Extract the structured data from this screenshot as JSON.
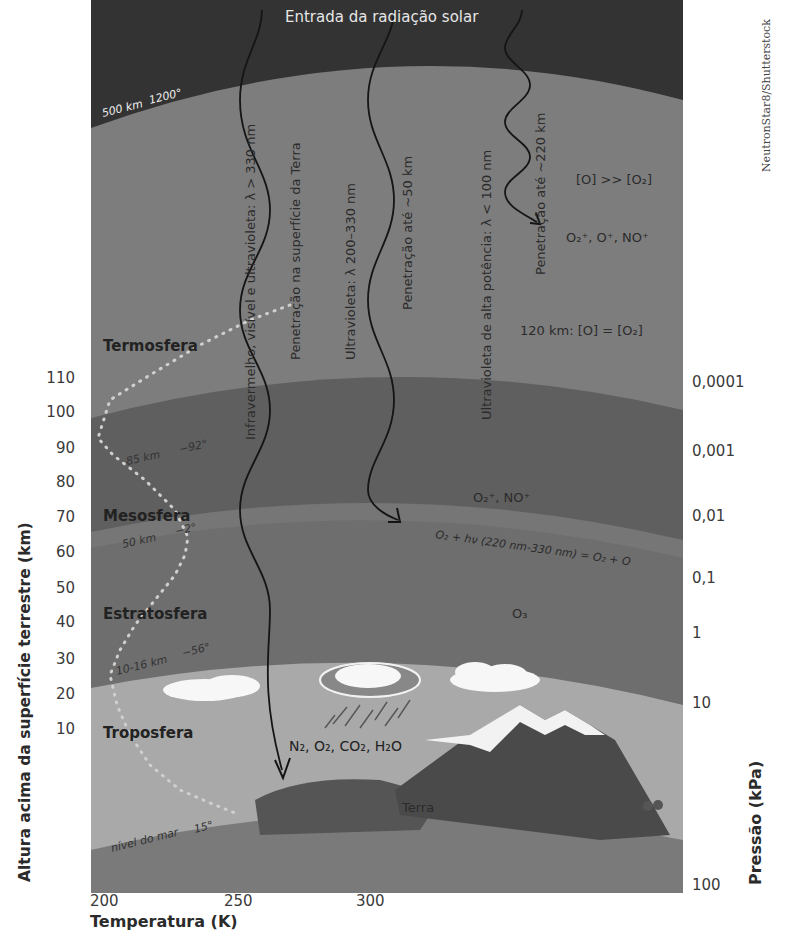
{
  "diagram": {
    "title": "Entrada da radiação solar",
    "credit": "NeutronStar8/Shutterstock",
    "layers": [
      {
        "name": "Termosfera",
        "top_km": "500 km",
        "top_temp": "1200°"
      },
      {
        "name": "Mesosfera",
        "top_km": "85 km",
        "top_temp": "−92°"
      },
      {
        "name": "Estratosfera",
        "top_km": "50 km",
        "top_temp": "−2°"
      },
      {
        "name": "Troposfera",
        "top_km": "10-16 km",
        "top_temp": "−56°"
      }
    ],
    "sea_level": {
      "label": "nível do mar",
      "temp": "15°"
    },
    "radiation": [
      {
        "label": "Infravermelho, visível e ultravioleta: λ > 330 nm",
        "penetration": "Penetração na superfície da Terra"
      },
      {
        "label": "Ultravioleta: λ 200–330 nm",
        "penetration": "Penetração até ~50 km"
      },
      {
        "label": "Ultravioleta de alta potência: λ < 100 nm",
        "penetration": "Penetração até ~220 km"
      }
    ],
    "chemistry": {
      "o_ratio": "[O] >> [O₂]",
      "thermo_ions": "O₂⁺, O⁺, NO⁺",
      "km120": "120 km: [O] = [O₂]",
      "meso_ions": "O₂⁺, NO⁺",
      "photolysis": "O₂ + hν (220 nm-330 nm) = O₂ + O",
      "ozone": "O₃",
      "tropo_gases": "N₂, O₂, CO₂, H₂O",
      "earth": "Terra"
    },
    "left_axis": {
      "title": "Altura acima da superfície terrestre (km)",
      "ticks": [
        "110",
        "100",
        "90",
        "80",
        "70",
        "60",
        "50",
        "40",
        "30",
        "20",
        "10"
      ]
    },
    "right_axis": {
      "title": "Pressão (kPa)",
      "ticks": [
        "0,0001",
        "0,001",
        "0,01",
        "0,1",
        "1",
        "10",
        "100"
      ]
    },
    "bottom_axis": {
      "title": "Temperatura (K)",
      "ticks": [
        "200",
        "250",
        "300"
      ]
    },
    "colors": {
      "space": "#333333",
      "thermosphere": "#7d7d7d",
      "mesosphere": "#5f5f5f",
      "stratosphere": "#6e6e6e",
      "troposphere": "#a9a9a9",
      "ground": "#7a7a7a",
      "mountain": "#4a4a4a"
    }
  }
}
